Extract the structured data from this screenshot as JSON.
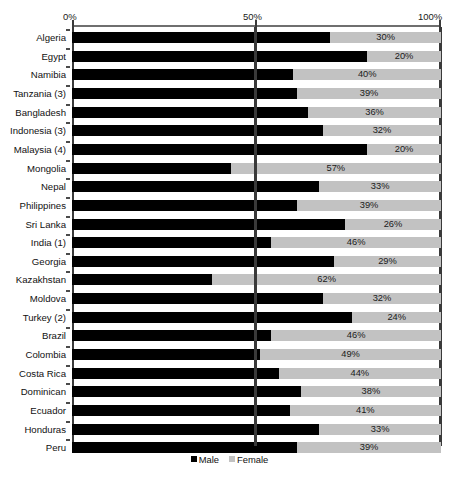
{
  "chart_data": {
    "type": "bar",
    "orientation": "horizontal",
    "stacked": true,
    "title": "",
    "xlabel": "",
    "ylabel": "",
    "xlim": [
      0,
      100
    ],
    "xticks": [
      "0%",
      "50%",
      "100%"
    ],
    "xtick_values": [
      0,
      50,
      100
    ],
    "grid": false,
    "midline_value": 50,
    "legend_position": "bottom-center",
    "categories": [
      "Algeria",
      "Egypt",
      "Namibia",
      "Tanzania (3)",
      "Bangladesh",
      "Indonesia (3)",
      "Malaysia (4)",
      "Mongolia",
      "Nepal",
      "Philippines",
      "Sri Lanka",
      "India (1)",
      "Georgia",
      "Kazakhstan",
      "Moldova",
      "Turkey (2)",
      "Brazil",
      "Colombia",
      "Costa Rica",
      "Dominican",
      "Ecuador",
      "Honduras",
      "Peru"
    ],
    "series": [
      {
        "name": "Male",
        "color": "#000000",
        "values": [
          70,
          80,
          60,
          61,
          64,
          68,
          80,
          43,
          67,
          61,
          74,
          54,
          71,
          38,
          68,
          76,
          54,
          51,
          56,
          62,
          59,
          67,
          61
        ]
      },
      {
        "name": "Female",
        "color": "#c2c2c2",
        "values": [
          30,
          20,
          40,
          39,
          36,
          32,
          20,
          57,
          33,
          39,
          26,
          46,
          29,
          62,
          32,
          24,
          46,
          49,
          44,
          38,
          41,
          33,
          39
        ]
      }
    ],
    "female_labels": [
      "30%",
      "20%",
      "40%",
      "39%",
      "36%",
      "32%",
      "20%",
      "57%",
      "33%",
      "39%",
      "26%",
      "46%",
      "29%",
      "62%",
      "32%",
      "24%",
      "46%",
      "49%",
      "44%",
      "38%",
      "41%",
      "33%",
      "39%"
    ]
  },
  "legend": {
    "entries": [
      {
        "label": "Male",
        "swatch": "male"
      },
      {
        "label": "Female",
        "swatch": "female"
      }
    ]
  }
}
